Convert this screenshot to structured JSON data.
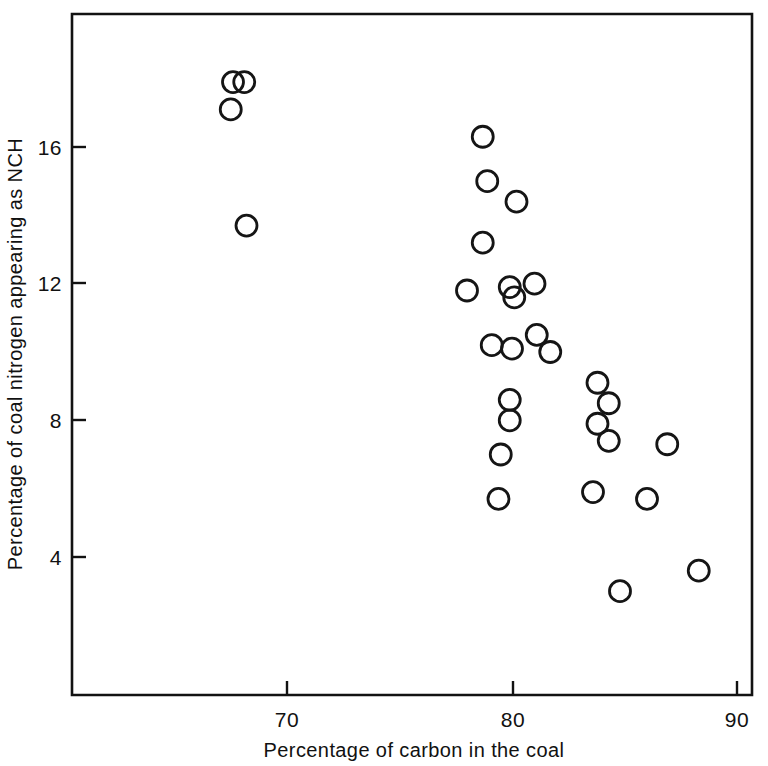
{
  "chart_data": {
    "type": "scatter",
    "title": "",
    "xlabel": "Percentage of carbon in the coal",
    "ylabel": "Percentage of coal nitrogen appearing as NCH",
    "xlim": [
      62.8,
      90.7
    ],
    "ylim": [
      0.6,
      19.4
    ],
    "xticks": [
      70,
      80,
      90
    ],
    "xtick_labels": [
      "70",
      "80",
      "90"
    ],
    "yticks": [
      4,
      8,
      12,
      16
    ],
    "ytick_labels": [
      "4",
      "8",
      "12",
      "16"
    ],
    "grid": false,
    "legend": null,
    "marker": "open-circle",
    "n_points": 31,
    "points": [
      {
        "x": 67.6,
        "y": 17.9
      },
      {
        "x": 68.1,
        "y": 17.9
      },
      {
        "x": 67.5,
        "y": 17.1
      },
      {
        "x": 68.2,
        "y": 13.7
      },
      {
        "x": 78.7,
        "y": 16.3
      },
      {
        "x": 78.9,
        "y": 15.0
      },
      {
        "x": 80.2,
        "y": 14.4
      },
      {
        "x": 78.7,
        "y": 13.2
      },
      {
        "x": 78.0,
        "y": 11.8
      },
      {
        "x": 79.9,
        "y": 11.9
      },
      {
        "x": 80.1,
        "y": 11.6
      },
      {
        "x": 81.0,
        "y": 12.0
      },
      {
        "x": 79.1,
        "y": 10.2
      },
      {
        "x": 80.0,
        "y": 10.1
      },
      {
        "x": 81.1,
        "y": 10.5
      },
      {
        "x": 81.7,
        "y": 10.0
      },
      {
        "x": 83.8,
        "y": 9.1
      },
      {
        "x": 79.9,
        "y": 8.6
      },
      {
        "x": 84.3,
        "y": 8.5
      },
      {
        "x": 79.9,
        "y": 8.0
      },
      {
        "x": 83.8,
        "y": 7.9
      },
      {
        "x": 79.5,
        "y": 7.0
      },
      {
        "x": 84.3,
        "y": 7.4
      },
      {
        "x": 86.9,
        "y": 7.3
      },
      {
        "x": 83.6,
        "y": 5.9
      },
      {
        "x": 79.4,
        "y": 5.7
      },
      {
        "x": 86.0,
        "y": 5.7
      },
      {
        "x": 84.8,
        "y": 3.0
      },
      {
        "x": 88.3,
        "y": 3.6
      }
    ]
  },
  "axis": {
    "x_title": "Percentage of carbon in the coal",
    "y_title": "Percentage of coal nitrogen appearing as NCH",
    "x_tick_70": "70",
    "x_tick_80": "80",
    "x_tick_90": "90",
    "y_tick_4": "4",
    "y_tick_8": "8",
    "y_tick_12": "12",
    "y_tick_16": "16"
  },
  "style": {
    "axis_color": "#121212",
    "marker_color": "#151515",
    "background": "#ffffff"
  }
}
